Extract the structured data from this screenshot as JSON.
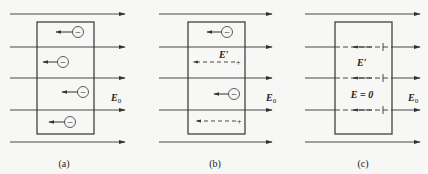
{
  "figure": {
    "colors": {
      "line": "#333333",
      "background": "#f7f7f5"
    },
    "panels": [
      {
        "id": "a",
        "caption": "(a)",
        "field_label": "E",
        "field_sub": "0",
        "charges": [
          "−",
          "−",
          "−",
          "−"
        ]
      },
      {
        "id": "b",
        "caption": "(b)",
        "field_label": "E",
        "field_sub": "0",
        "induced_label": "E′",
        "charges": [
          "−",
          "−"
        ],
        "plus": [
          "+",
          "+"
        ]
      },
      {
        "id": "c",
        "caption": "(c)",
        "field_label": "E",
        "field_sub": "0",
        "induced_label": "E′",
        "inside_label": "E = 0"
      }
    ]
  }
}
